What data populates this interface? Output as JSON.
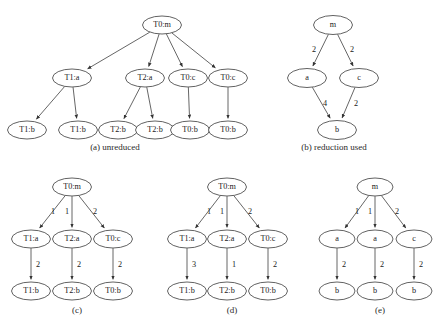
{
  "figure": {
    "width": 446,
    "height": 328,
    "background": "#ffffff",
    "node_stroke": "#3a3a3a",
    "node_fill": "#ffffff",
    "edge_stroke": "#555555",
    "text_color": "#1a1a1a",
    "node_font_size": 8.2,
    "edge_font_size": 8.2,
    "caption_font_size": 9.0,
    "node_rx": 19.5,
    "node_ry": 9.0
  },
  "panels": [
    {
      "id": "panel-a",
      "caption": "(a) unreduced",
      "caption_x": 115,
      "caption_y": 148,
      "node_rx": 19.5,
      "node_ry": 9.0,
      "nodes": [
        {
          "id": "a-root",
          "label": "T0:m",
          "x": 162,
          "y": 25
        },
        {
          "id": "a-t1a",
          "label": "T1:a",
          "x": 72,
          "y": 78
        },
        {
          "id": "a-t2a",
          "label": "T2:a",
          "x": 145,
          "y": 78
        },
        {
          "id": "a-t0c1",
          "label": "T0:c",
          "x": 188,
          "y": 78
        },
        {
          "id": "a-t0c2",
          "label": "T0:c",
          "x": 228,
          "y": 78
        },
        {
          "id": "a-t1b1",
          "label": "T1:b",
          "x": 27,
          "y": 130
        },
        {
          "id": "a-t1b2",
          "label": "T1:b",
          "x": 78,
          "y": 130
        },
        {
          "id": "a-t2b1",
          "label": "T2:b",
          "x": 118,
          "y": 130
        },
        {
          "id": "a-t2b2",
          "label": "T2:b",
          "x": 155,
          "y": 130
        },
        {
          "id": "a-t0b1",
          "label": "T0:b",
          "x": 190,
          "y": 130
        },
        {
          "id": "a-t0b2",
          "label": "T0:b",
          "x": 228,
          "y": 130
        }
      ],
      "edges": [
        {
          "from": "a-root",
          "to": "a-t1a",
          "label": ""
        },
        {
          "from": "a-root",
          "to": "a-t2a",
          "label": ""
        },
        {
          "from": "a-root",
          "to": "a-t0c1",
          "label": ""
        },
        {
          "from": "a-root",
          "to": "a-t0c2",
          "label": ""
        },
        {
          "from": "a-t1a",
          "to": "a-t1b1",
          "label": ""
        },
        {
          "from": "a-t1a",
          "to": "a-t1b2",
          "label": ""
        },
        {
          "from": "a-t2a",
          "to": "a-t2b1",
          "label": ""
        },
        {
          "from": "a-t2a",
          "to": "a-t2b2",
          "label": ""
        },
        {
          "from": "a-t0c1",
          "to": "a-t0b1",
          "label": ""
        },
        {
          "from": "a-t0c2",
          "to": "a-t0b2",
          "label": ""
        }
      ]
    },
    {
      "id": "panel-b",
      "caption": "(b) reduction used",
      "caption_x": 334,
      "caption_y": 148,
      "node_rx": 19.5,
      "node_ry": 9.5,
      "nodes": [
        {
          "id": "b-m",
          "label": "m",
          "x": 333,
          "y": 25
        },
        {
          "id": "b-a",
          "label": "a",
          "x": 307,
          "y": 78
        },
        {
          "id": "b-c",
          "label": "c",
          "x": 359,
          "y": 78
        },
        {
          "id": "b-b",
          "label": "b",
          "x": 337,
          "y": 130
        }
      ],
      "edges": [
        {
          "from": "b-m",
          "to": "b-a",
          "label": "2",
          "lx": 314,
          "ly": 50
        },
        {
          "from": "b-m",
          "to": "b-c",
          "label": "2",
          "lx": 352,
          "ly": 50
        },
        {
          "from": "b-a",
          "to": "b-b",
          "label": "4",
          "lx": 325,
          "ly": 104
        },
        {
          "from": "b-c",
          "to": "b-b",
          "label": "2",
          "lx": 356,
          "ly": 104
        }
      ]
    },
    {
      "id": "panel-c",
      "caption": "(c)",
      "caption_x": 77,
      "caption_y": 311,
      "node_rx": 19.5,
      "node_ry": 9.0,
      "nodes": [
        {
          "id": "c-root",
          "label": "T0:m",
          "x": 72,
          "y": 187
        },
        {
          "id": "c-t1a",
          "label": "T1:a",
          "x": 31,
          "y": 239
        },
        {
          "id": "c-t2a",
          "label": "T2:a",
          "x": 72,
          "y": 239
        },
        {
          "id": "c-t0c",
          "label": "T0:c",
          "x": 113,
          "y": 239
        },
        {
          "id": "c-t1b",
          "label": "T1:b",
          "x": 31,
          "y": 291
        },
        {
          "id": "c-t2b",
          "label": "T2:b",
          "x": 72,
          "y": 291
        },
        {
          "id": "c-t0b",
          "label": "T0:b",
          "x": 113,
          "y": 291
        }
      ],
      "edges": [
        {
          "from": "c-root",
          "to": "c-t1a",
          "label": "1",
          "lx": 53,
          "ly": 212
        },
        {
          "from": "c-root",
          "to": "c-t2a",
          "label": "1",
          "lx": 67,
          "ly": 212
        },
        {
          "from": "c-root",
          "to": "c-t0c",
          "label": "2",
          "lx": 95,
          "ly": 212
        },
        {
          "from": "c-t1a",
          "to": "c-t1b",
          "label": "2",
          "lx": 38,
          "ly": 265
        },
        {
          "from": "c-t2a",
          "to": "c-t2b",
          "label": "2",
          "lx": 79,
          "ly": 265
        },
        {
          "from": "c-t0c",
          "to": "c-t0b",
          "label": "2",
          "lx": 120,
          "ly": 265
        }
      ]
    },
    {
      "id": "panel-d",
      "caption": "(d)",
      "caption_x": 232,
      "caption_y": 311,
      "node_rx": 19.5,
      "node_ry": 9.0,
      "nodes": [
        {
          "id": "d-root",
          "label": "T0:m",
          "x": 227,
          "y": 187
        },
        {
          "id": "d-t1a",
          "label": "T1:a",
          "x": 187,
          "y": 239
        },
        {
          "id": "d-t2a",
          "label": "T2:a",
          "x": 227,
          "y": 239
        },
        {
          "id": "d-t0c",
          "label": "T0:c",
          "x": 268,
          "y": 239
        },
        {
          "id": "d-t1b",
          "label": "T1:b",
          "x": 187,
          "y": 291
        },
        {
          "id": "d-t2b",
          "label": "T2:b",
          "x": 227,
          "y": 291
        },
        {
          "id": "d-t0b",
          "label": "T0:b",
          "x": 268,
          "y": 291
        }
      ],
      "edges": [
        {
          "from": "d-root",
          "to": "d-t1a",
          "label": "1",
          "lx": 209,
          "ly": 212
        },
        {
          "from": "d-root",
          "to": "d-t2a",
          "label": "1",
          "lx": 222,
          "ly": 212
        },
        {
          "from": "d-root",
          "to": "d-t0c",
          "label": "2",
          "lx": 250,
          "ly": 212
        },
        {
          "from": "d-t1a",
          "to": "d-t1b",
          "label": "3",
          "lx": 194,
          "ly": 265
        },
        {
          "from": "d-t2a",
          "to": "d-t2b",
          "label": "1",
          "lx": 234,
          "ly": 265
        },
        {
          "from": "d-t0c",
          "to": "d-t0b",
          "label": "2",
          "lx": 275,
          "ly": 265
        }
      ]
    },
    {
      "id": "panel-e",
      "caption": "(e)",
      "caption_x": 380,
      "caption_y": 311,
      "node_rx": 18.0,
      "node_ry": 9.0,
      "nodes": [
        {
          "id": "e-m",
          "label": "m",
          "x": 375,
          "y": 187
        },
        {
          "id": "e-a1",
          "label": "a",
          "x": 337,
          "y": 239
        },
        {
          "id": "e-a2",
          "label": "a",
          "x": 375,
          "y": 239
        },
        {
          "id": "e-c",
          "label": "c",
          "x": 414,
          "y": 239
        },
        {
          "id": "e-b1",
          "label": "b",
          "x": 337,
          "y": 291
        },
        {
          "id": "e-b2",
          "label": "b",
          "x": 375,
          "y": 291
        },
        {
          "id": "e-b3",
          "label": "b",
          "x": 414,
          "y": 291
        }
      ],
      "edges": [
        {
          "from": "e-m",
          "to": "e-a1",
          "label": "1",
          "lx": 357,
          "ly": 212
        },
        {
          "from": "e-m",
          "to": "e-a2",
          "label": "1",
          "lx": 370,
          "ly": 212
        },
        {
          "from": "e-m",
          "to": "e-c",
          "label": "2",
          "lx": 397,
          "ly": 212
        },
        {
          "from": "e-a1",
          "to": "e-b1",
          "label": "2",
          "lx": 344,
          "ly": 265
        },
        {
          "from": "e-a2",
          "to": "e-b2",
          "label": "2",
          "lx": 382,
          "ly": 265
        },
        {
          "from": "e-c",
          "to": "e-b3",
          "label": "2",
          "lx": 421,
          "ly": 265
        }
      ]
    }
  ]
}
